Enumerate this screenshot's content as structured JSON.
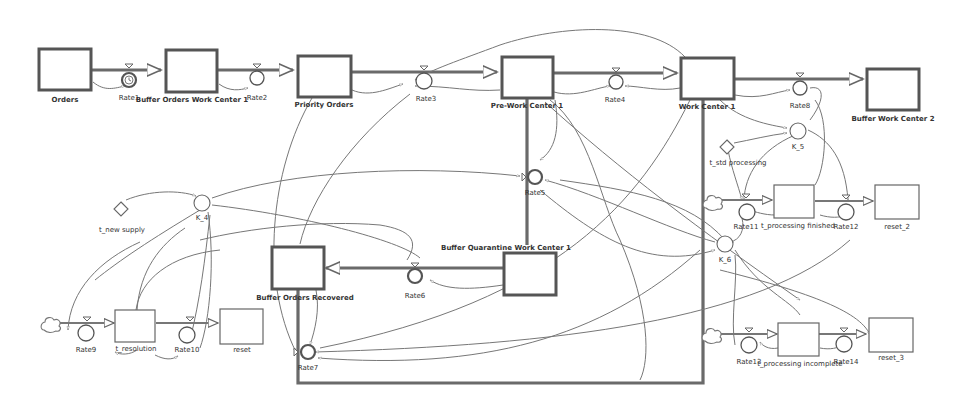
{
  "diagram": {
    "type": "stock-and-flow",
    "stocks": [
      {
        "id": "orders",
        "label": "Orders"
      },
      {
        "id": "buffer_orders_wc1",
        "label": "Buffer Orders Work Center 1"
      },
      {
        "id": "priority_orders",
        "label": "Priority Orders"
      },
      {
        "id": "pre_wc1",
        "label": "Pre-Work Center 1"
      },
      {
        "id": "wc1",
        "label": "Work Center 1"
      },
      {
        "id": "buffer_wc2",
        "label": "Buffer Work Center 2"
      },
      {
        "id": "buffer_quarantine_wc1",
        "label": "Buffer Quarantine Work Center 1"
      },
      {
        "id": "buffer_orders_recovered",
        "label": "Buffer Orders Recovered"
      },
      {
        "id": "t_resolution",
        "label": "t_resolution"
      },
      {
        "id": "reset",
        "label": "reset"
      },
      {
        "id": "t_processing_finished",
        "label": "t_processing finished"
      },
      {
        "id": "reset_2",
        "label": "reset_2"
      },
      {
        "id": "t_processing_incomplete",
        "label": "t_processing incomplete"
      },
      {
        "id": "reset_3",
        "label": "reset_3"
      }
    ],
    "rates": [
      {
        "id": "rate1",
        "label": "Rate1",
        "icon": "clock-icon"
      },
      {
        "id": "rate2",
        "label": "Rate2"
      },
      {
        "id": "rate3",
        "label": "Rate3"
      },
      {
        "id": "rate4",
        "label": "Rate4"
      },
      {
        "id": "rate5",
        "label": "Rate5"
      },
      {
        "id": "rate6",
        "label": "Rate6"
      },
      {
        "id": "rate7",
        "label": "Rate7"
      },
      {
        "id": "rate8",
        "label": "Rate8"
      },
      {
        "id": "rate9",
        "label": "Rate9"
      },
      {
        "id": "rate10",
        "label": "Rate10"
      },
      {
        "id": "rate11",
        "label": "Rate11"
      },
      {
        "id": "rate12",
        "label": "Rate12"
      },
      {
        "id": "rate13",
        "label": "Rate13"
      },
      {
        "id": "rate14",
        "label": "Rate14"
      }
    ],
    "auxiliaries": [
      {
        "id": "k4",
        "label": "K_4"
      },
      {
        "id": "k5",
        "label": "K_5"
      },
      {
        "id": "k6",
        "label": "K_6"
      }
    ],
    "constants": [
      {
        "id": "t_new_supply",
        "label": "t_new supply"
      },
      {
        "id": "t_std_processing",
        "label": "t_std processing"
      }
    ],
    "colors": {
      "stock_border": "#555555",
      "link": "#777777",
      "background": "#ffffff",
      "text": "#333333"
    }
  }
}
